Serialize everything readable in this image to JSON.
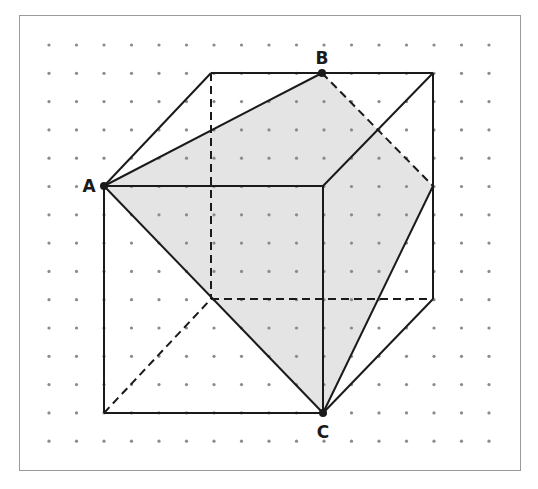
{
  "diagram": {
    "colors": {
      "background": "#ffffff",
      "frame": "#9a9a9a",
      "dot": "#8a8a8a",
      "edge": "#1a1a1a",
      "shade": "#e4e4e4"
    },
    "grid": {
      "x0": 49,
      "dx": 27.5,
      "cols": 17,
      "y0": 45,
      "dy": 28.3,
      "rows": 15,
      "dot_radius": 1.6
    },
    "points": {
      "A": {
        "label": "A",
        "x": 104,
        "y": 186,
        "label_dx": -15,
        "label_dy": 6
      },
      "B": {
        "label": "B",
        "x": 322,
        "y": 73,
        "label_dx": 0,
        "label_dy": -9
      },
      "C": {
        "label": "C",
        "x": 323,
        "y": 413,
        "label_dx": 0,
        "label_dy": 25
      }
    },
    "vertices": {
      "front_top_left": [
        104,
        186
      ],
      "front_top_right": [
        323,
        186
      ],
      "front_bottom_left": [
        104,
        413
      ],
      "front_bottom_right": [
        323,
        413
      ],
      "back_top_left": [
        211,
        73
      ],
      "back_top_right": [
        433,
        73
      ],
      "back_bottom_left": [
        211,
        299
      ],
      "back_bottom_right": [
        433,
        299
      ],
      "edge_mid_right": [
        433,
        186
      ]
    },
    "shaded_polygon": [
      [
        104,
        186
      ],
      [
        322,
        73
      ],
      [
        433,
        186
      ],
      [
        323,
        413
      ]
    ],
    "solid_edges": [
      [
        [
          104,
          186
        ],
        [
          323,
          186
        ]
      ],
      [
        [
          104,
          186
        ],
        [
          104,
          413
        ]
      ],
      [
        [
          104,
          413
        ],
        [
          323,
          413
        ]
      ],
      [
        [
          323,
          186
        ],
        [
          323,
          413
        ]
      ],
      [
        [
          211,
          73
        ],
        [
          433,
          73
        ]
      ],
      [
        [
          433,
          73
        ],
        [
          433,
          299
        ]
      ],
      [
        [
          104,
          186
        ],
        [
          211,
          73
        ]
      ],
      [
        [
          323,
          186
        ],
        [
          433,
          73
        ]
      ],
      [
        [
          433,
          299
        ],
        [
          323,
          413
        ]
      ],
      [
        [
          104,
          186
        ],
        [
          322,
          73
        ]
      ],
      [
        [
          104,
          186
        ],
        [
          323,
          413
        ]
      ],
      [
        [
          433,
          186
        ],
        [
          323,
          413
        ]
      ]
    ],
    "dashed_edges": [
      [
        [
          211,
          73
        ],
        [
          211,
          299
        ]
      ],
      [
        [
          211,
          299
        ],
        [
          433,
          299
        ]
      ],
      [
        [
          104,
          413
        ],
        [
          211,
          299
        ]
      ],
      [
        [
          322,
          73
        ],
        [
          433,
          186
        ]
      ]
    ]
  }
}
